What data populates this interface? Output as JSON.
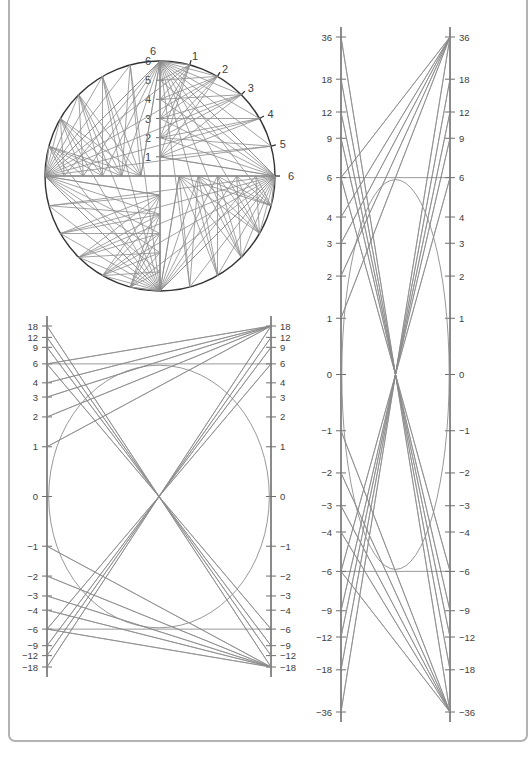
{
  "figure": {
    "background_color": "#ffffff",
    "frame_color": "#b3b3b3",
    "line_color": "#8c8c8c",
    "axis_color": "#6e6e6e",
    "heavy_color": "#333333",
    "label_color": "#404040"
  },
  "chart_data": [
    {
      "id": "circle-chord-diagram",
      "type": "line",
      "title": "",
      "xlabel": "",
      "ylabel": "",
      "description": "Circle of unit radius with a vertical diameter scale and an arc scale; chords join matching scale marks producing a four-fold rotationally symmetric envelope.",
      "grid": false,
      "legend": null,
      "center_px": [
        160,
        176
      ],
      "radius_px": 115,
      "axis_ticks": {
        "vertical_scale_labels": [
          "1",
          "2",
          "3",
          "4",
          "5",
          "6"
        ],
        "vertical_scale_values": [
          1,
          2,
          3,
          4,
          5,
          6
        ],
        "arc_scale_labels": [
          "1",
          "2",
          "3",
          "4",
          "5",
          "6"
        ],
        "arc_scale_values": [
          1,
          2,
          3,
          4,
          5,
          6
        ]
      },
      "notes": "Vertical marks 1..6 run from centre upward to the top of the circle; arc marks 1..6 run clockwise from the top of the circle to the right-hand end of the horizontal diameter."
    },
    {
      "id": "nomogram-18",
      "type": "line",
      "title": "",
      "xlabel": "",
      "ylabel": "",
      "description": "Two parallel projective (reciprocal) scales running from +18 to -18; straight connectors between matched readings envelope an ellipse.",
      "grid": false,
      "legend": null,
      "ylim": [
        -18,
        18
      ],
      "tick_labels": [
        "18",
        "12",
        "9",
        "6",
        "4",
        "3",
        "2",
        "1",
        "0",
        "−1",
        "−2",
        "−3",
        "−4",
        "−6",
        "−9",
        "−12",
        "−18"
      ],
      "tick_values": [
        18,
        12,
        9,
        6,
        4,
        3,
        2,
        1,
        0,
        -1,
        -2,
        -3,
        -4,
        -6,
        -9,
        -12,
        -18
      ],
      "left_axis_x_px": 47,
      "right_axis_x_px": 271,
      "top_y_px": 326,
      "bottom_y_px": 667,
      "envelope": "ellipse"
    },
    {
      "id": "nomogram-36",
      "type": "line",
      "title": "",
      "xlabel": "",
      "ylabel": "",
      "description": "Two parallel projective (reciprocal) scales running from +36 to -36; straight connectors between matched readings envelope a circle.",
      "grid": false,
      "legend": null,
      "ylim": [
        -36,
        36
      ],
      "tick_labels": [
        "36",
        "18",
        "12",
        "9",
        "6",
        "4",
        "3",
        "2",
        "1",
        "0",
        "−1",
        "−2",
        "−3",
        "−4",
        "−6",
        "−9",
        "−12",
        "−18",
        "−36"
      ],
      "tick_values": [
        36,
        18,
        12,
        9,
        6,
        4,
        3,
        2,
        1,
        0,
        -1,
        -2,
        -3,
        -4,
        -6,
        -9,
        -12,
        -18,
        -36
      ],
      "left_axis_x_px": 341,
      "right_axis_x_px": 450,
      "top_y_px": 37,
      "bottom_y_px": 712,
      "envelope": "circle"
    }
  ]
}
